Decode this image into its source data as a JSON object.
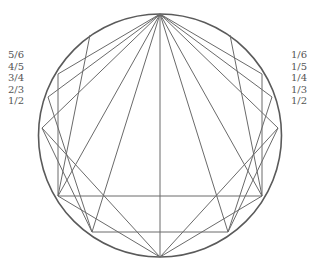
{
  "diagram": {
    "left_labels": [
      "5/6",
      "4/5",
      "3/4",
      "2/3",
      "1/2"
    ],
    "right_labels": [
      "1/6",
      "1/5",
      "1/4",
      "1/3",
      "1/2"
    ],
    "stroke_color": "#666666",
    "label_color": "#555555"
  }
}
